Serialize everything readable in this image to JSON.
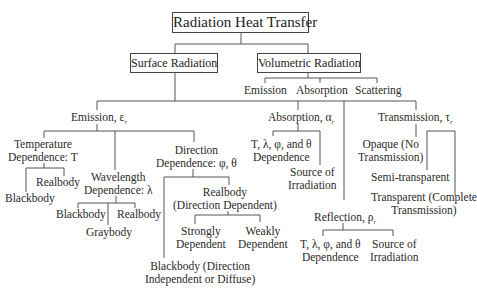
{
  "root": "Radiation Heat Transfer",
  "surface": {
    "label": "Surface Radiation",
    "emission": {
      "label": "Emission, ε",
      "temperature": {
        "label1": "Temperature",
        "label2": "Dependence: T",
        "children": [
          "Realbody",
          "Blackbody"
        ]
      },
      "wavelength": {
        "label1": "Wavelength",
        "label2": "Dependence: λ",
        "children": [
          "Blackbody",
          "Realbody",
          "Graybody"
        ]
      },
      "direction": {
        "label1": "Direction",
        "label2": "Dependence: φ, θ",
        "realbody": {
          "label1": "Realbody",
          "label2": "(Direction Dependent)",
          "children": [
            [
              "Strongly",
              "Dependent"
            ],
            [
              "Weakly",
              "Dependent"
            ]
          ]
        },
        "blackbody": {
          "label1": "Blackbody (Direction",
          "label2": "Independent or Diffuse)"
        }
      }
    },
    "absorption": {
      "label": "Absorption, α",
      "dependence": {
        "label1": "T, λ, φ, and θ",
        "label2": "Dependence"
      },
      "source": {
        "label1": "Source of",
        "label2": "Irradiation"
      }
    },
    "reflection": {
      "label": "Reflection, ρ",
      "dependence": {
        "label1": "T, λ, φ, and θ",
        "label2": "Dependence"
      },
      "source": {
        "label1": "Source of",
        "label2": "Irradiation"
      }
    },
    "transmission": {
      "label": "Transmission, τ",
      "opaque": {
        "label1": "Opaque (No",
        "label2": "Transmission)"
      },
      "semi": "Semi-transparent",
      "transparent": {
        "label1": "Transparent (Complete",
        "label2": "Transmission)"
      }
    }
  },
  "volumetric": {
    "label": "Volumetric Radiation",
    "children": [
      "Emission",
      "Absorption",
      "Scattering"
    ]
  },
  "subscript": "r"
}
